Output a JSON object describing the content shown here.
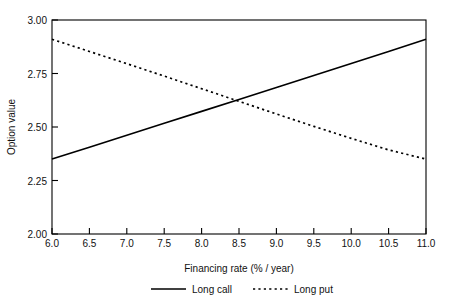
{
  "chart_data": {
    "type": "line",
    "title": "",
    "xlabel": "Financing rate (% / year)",
    "ylabel": "Option value",
    "xlim": [
      6.0,
      11.0
    ],
    "ylim": [
      2.0,
      3.0
    ],
    "grid": false,
    "legend_position": "bottom",
    "x": [
      6.0,
      6.5,
      7.0,
      7.5,
      8.0,
      8.5,
      9.0,
      9.5,
      10.0,
      10.5,
      11.0
    ],
    "xticks": [
      "6.0",
      "6.5",
      "7.0",
      "7.5",
      "8.0",
      "8.5",
      "9.0",
      "9.5",
      "10.0",
      "10.5",
      "11.0"
    ],
    "yticks": [
      "2.00",
      "2.25",
      "2.50",
      "2.75",
      "3.00"
    ],
    "series": [
      {
        "name": "Long call",
        "style": "solid",
        "color": "#000000",
        "values": [
          2.35,
          2.405,
          2.461,
          2.517,
          2.573,
          2.629,
          2.685,
          2.741,
          2.797,
          2.853,
          2.91
        ]
      },
      {
        "name": "Long put",
        "style": "dotted",
        "color": "#000000",
        "values": [
          2.91,
          2.853,
          2.796,
          2.738,
          2.679,
          2.62,
          2.561,
          2.503,
          2.447,
          2.393,
          2.35
        ]
      }
    ],
    "intersection": {
      "x": 8.55,
      "y": 2.62
    }
  },
  "axes": {
    "y_title": "Option value",
    "x_title": "Financing rate (% / year)"
  },
  "legend": {
    "entries": [
      {
        "label": "Long call",
        "style": "solid"
      },
      {
        "label": "Long put",
        "style": "dotted"
      }
    ]
  },
  "top_cropped_text": ""
}
